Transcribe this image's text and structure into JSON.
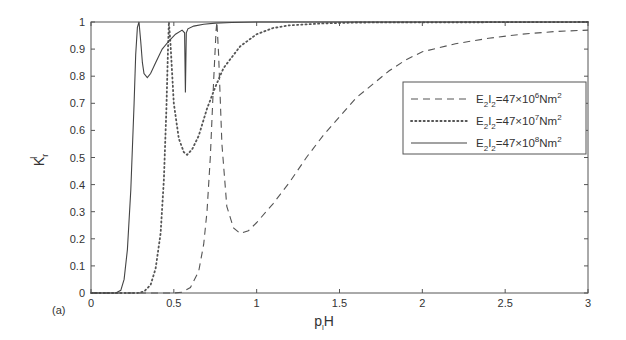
{
  "chart_data": {
    "type": "line",
    "panel_label": "(a)",
    "title": "",
    "xlabel": "p_l H",
    "xlabel_main": "p",
    "xlabel_sub": "l",
    "xlabel_tail": "H",
    "ylabel": "K_r^l",
    "ylabel_main": "K",
    "ylabel_sub": "r",
    "ylabel_sup": "l",
    "xlim": [
      0,
      3
    ],
    "ylim": [
      0,
      1
    ],
    "xticks": [
      0,
      0.5,
      1,
      1.5,
      2,
      2.5,
      3
    ],
    "xtick_labels": [
      "0",
      "0.5",
      "1",
      "1.5",
      "2",
      "2.5",
      "3"
    ],
    "yticks": [
      0,
      0.1,
      0.2,
      0.3,
      0.4,
      0.5,
      0.6,
      0.7,
      0.8,
      0.9,
      1
    ],
    "ytick_labels": [
      "0",
      "0.1",
      "0.2",
      "0.3",
      "0.4",
      "0.5",
      "0.6",
      "0.7",
      "0.8",
      "0.9",
      "1"
    ],
    "grid": false,
    "legend_position": "upper right (inside)",
    "series": [
      {
        "name": "E2I2=47x10^6 Nm^2",
        "legend": {
          "pre": "E",
          "s1": "2",
          "mid": "I",
          "s2": "2",
          "eq": "=47×10",
          "exp": "6",
          "unit": "Nm",
          "uexp": "2"
        },
        "style": "dashed",
        "color": "#555555",
        "x": [
          0,
          0.5,
          0.55,
          0.6,
          0.65,
          0.68,
          0.7,
          0.72,
          0.74,
          0.755,
          0.76,
          0.77,
          0.79,
          0.82,
          0.86,
          0.9,
          0.95,
          1.0,
          1.1,
          1.2,
          1.3,
          1.4,
          1.5,
          1.6,
          1.7,
          1.8,
          1.9,
          2.0,
          2.2,
          2.4,
          2.6,
          2.8,
          3.0
        ],
        "y": [
          0,
          0,
          0.003,
          0.02,
          0.08,
          0.18,
          0.3,
          0.5,
          0.78,
          0.97,
          1.0,
          0.88,
          0.55,
          0.32,
          0.24,
          0.22,
          0.23,
          0.26,
          0.33,
          0.41,
          0.5,
          0.58,
          0.65,
          0.72,
          0.77,
          0.82,
          0.86,
          0.89,
          0.92,
          0.94,
          0.955,
          0.965,
          0.97
        ]
      },
      {
        "name": "E2I2=47x10^7 Nm^2",
        "legend": {
          "pre": "E",
          "s1": "2",
          "mid": "I",
          "s2": "2",
          "eq": "=47×10",
          "exp": "7",
          "unit": "Nm",
          "uexp": "2"
        },
        "style": "dotted",
        "color": "#555555",
        "x": [
          0,
          0.28,
          0.32,
          0.36,
          0.39,
          0.42,
          0.44,
          0.455,
          0.465,
          0.47,
          0.48,
          0.5,
          0.53,
          0.56,
          0.58,
          0.61,
          0.65,
          0.7,
          0.75,
          0.8,
          0.9,
          1.0,
          1.1,
          1.2,
          1.4,
          1.6,
          3.0
        ],
        "y": [
          0,
          0,
          0.005,
          0.03,
          0.09,
          0.22,
          0.42,
          0.68,
          0.9,
          1.0,
          0.92,
          0.7,
          0.57,
          0.52,
          0.51,
          0.53,
          0.58,
          0.68,
          0.76,
          0.83,
          0.91,
          0.955,
          0.978,
          0.988,
          0.995,
          0.998,
          1.0
        ]
      },
      {
        "name": "E2I2=47x10^8 Nm^2",
        "legend": {
          "pre": "E",
          "s1": "2",
          "mid": "I",
          "s2": "2",
          "eq": "=47×10",
          "exp": "8",
          "unit": "Nm",
          "uexp": "2"
        },
        "style": "solid",
        "color": "#444444",
        "x": [
          0,
          0.15,
          0.18,
          0.2,
          0.22,
          0.24,
          0.26,
          0.27,
          0.28,
          0.29,
          0.3,
          0.31,
          0.32,
          0.34,
          0.36,
          0.39,
          0.43,
          0.47,
          0.51,
          0.55,
          0.565,
          0.57,
          0.575,
          0.585,
          0.62,
          0.68,
          0.75,
          0.85,
          1.0,
          3.0
        ],
        "y": [
          0,
          0,
          0.01,
          0.05,
          0.16,
          0.38,
          0.7,
          0.88,
          0.98,
          1.0,
          0.93,
          0.85,
          0.81,
          0.795,
          0.81,
          0.85,
          0.9,
          0.93,
          0.955,
          0.97,
          0.96,
          0.74,
          0.96,
          0.975,
          0.985,
          0.992,
          0.996,
          0.998,
          1.0,
          1.0
        ]
      }
    ]
  }
}
